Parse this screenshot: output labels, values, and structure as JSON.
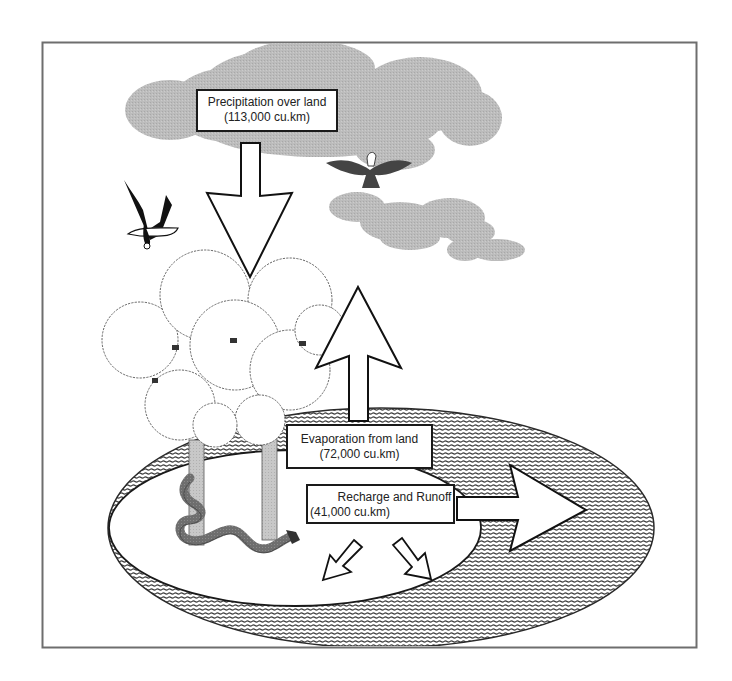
{
  "diagram": {
    "colors": {
      "frame_border": "#6e6e6e",
      "cloud": "#b9b9b9",
      "hatch": "#3c3c3c",
      "trunk": "#c4c4c4",
      "snake": "#6b6b6b",
      "outline": "#1a1a1a"
    },
    "labels": {
      "precipitation": {
        "title": "Precipitation over land",
        "value": "(113,000 cu.km)"
      },
      "evaporation": {
        "title": "Evaporation from land",
        "value": "(72,000 cu.km)"
      },
      "recharge": {
        "title": "Recharge and Runoff",
        "value": "(41,000 cu.km)"
      }
    },
    "flows": [
      {
        "name": "Precipitation over land",
        "amount": 113000,
        "unit": "cu.km",
        "direction": "down"
      },
      {
        "name": "Evaporation from land",
        "amount": 72000,
        "unit": "cu.km",
        "direction": "up"
      },
      {
        "name": "Recharge and Runoff",
        "amount": 41000,
        "unit": "cu.km",
        "direction": "right-down"
      }
    ],
    "icons": [
      "cloud-icon",
      "eagle-icon",
      "tree-icon",
      "snake-icon",
      "arrow-icon"
    ]
  }
}
